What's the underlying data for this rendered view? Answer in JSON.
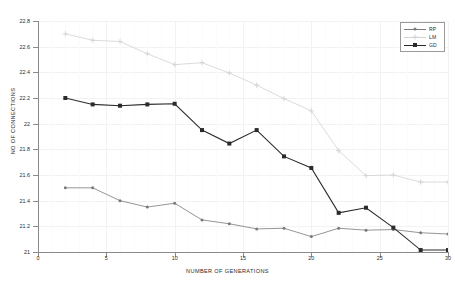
{
  "chart_data": {
    "type": "line",
    "title": "",
    "xlabel": "NUMBER OF GENERATIONS",
    "ylabel": "NO OF CONNECTIONS",
    "xlim": [
      0,
      30
    ],
    "ylim": [
      21,
      22.8
    ],
    "xticks": [
      0,
      5,
      10,
      15,
      20,
      25,
      30
    ],
    "yticks": [
      21,
      21.2,
      21.4,
      21.6,
      21.8,
      22,
      22.2,
      22.4,
      22.6,
      22.8
    ],
    "xtick_labels": [
      "0",
      "5",
      "10",
      "15",
      "20",
      "25",
      "30"
    ],
    "ytick_labels": [
      "21",
      "21.2",
      "21.4",
      "21.6",
      "21.8",
      "22",
      "22.2",
      "22.4",
      "22.6",
      "22.8"
    ],
    "grid": true,
    "legend_position": "top-right",
    "x": [
      2,
      4,
      6,
      8,
      10,
      12,
      14,
      16,
      18,
      20,
      22,
      24,
      26,
      28,
      30
    ],
    "series": [
      {
        "name": "RP",
        "color": "#7a7a7a",
        "marker": "dot",
        "values": [
          21.5,
          21.5,
          21.4,
          21.35,
          21.38,
          21.25,
          21.22,
          21.18,
          21.185,
          21.12,
          21.185,
          21.17,
          21.175,
          21.15,
          21.14
        ]
      },
      {
        "name": "LM",
        "color": "#d2d2d2",
        "marker": "plus",
        "values": [
          22.7,
          22.65,
          22.64,
          22.545,
          22.46,
          22.475,
          22.395,
          22.3,
          22.195,
          22.1,
          21.79,
          21.595,
          21.6,
          21.545,
          21.545
        ]
      },
      {
        "name": "GD",
        "color": "#2b2b2b",
        "marker": "square",
        "values": [
          22.2,
          22.15,
          22.14,
          22.15,
          22.155,
          21.95,
          21.845,
          21.95,
          21.745,
          21.655,
          21.305,
          21.345,
          21.19,
          21.015,
          21.015
        ]
      }
    ]
  },
  "legend": {
    "entries": [
      {
        "label": "RP"
      },
      {
        "label": "LM"
      },
      {
        "label": "GD"
      }
    ]
  }
}
